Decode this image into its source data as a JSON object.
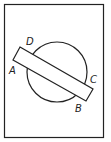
{
  "diagram": {
    "labels": {
      "A": "A",
      "B": "B",
      "C": "C",
      "D": "D"
    },
    "colors": {
      "stroke": "#222222",
      "background": "#ffffff"
    }
  }
}
